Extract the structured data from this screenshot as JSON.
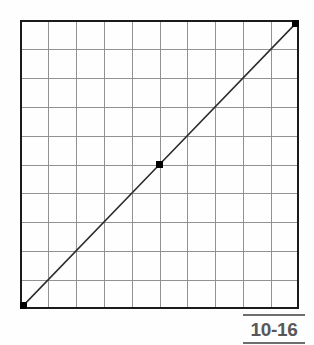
{
  "figure": {
    "caption_label": "10-16",
    "caption_rule_color": "#6e6e6e",
    "caption_text_color": "#58585a",
    "background_color": "#fefefe"
  },
  "chart_data": {
    "type": "line",
    "title": "",
    "subtitle": "",
    "xlabel": "",
    "ylabel": "",
    "xlim": [
      0,
      10
    ],
    "ylim": [
      0,
      10
    ],
    "grid": true,
    "grid_columns": 10,
    "grid_rows": 10,
    "grid_color": "#8c8c8c",
    "border_color": "#1a1a1a",
    "legend": "none",
    "xticklabels": [],
    "yticklabels": [],
    "series": [
      {
        "name": "line",
        "color": "#2b2b2b",
        "linewidth": 1.6,
        "marker": "square",
        "marker_color": "#000000",
        "marker_size": 7,
        "x": [
          0,
          5,
          10
        ],
        "y": [
          0,
          5,
          10
        ]
      }
    ],
    "annotations": []
  }
}
